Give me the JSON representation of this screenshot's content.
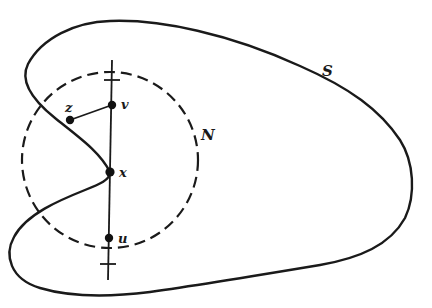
{
  "figure": {
    "colors": {
      "background": "#ffffff",
      "ink": "#1a1a1a"
    },
    "labels": {
      "curve": "S",
      "neighborhood": "N",
      "point_v": "v",
      "point_z": "z",
      "point_x": "x",
      "point_u": "u"
    },
    "elements": {
      "curve_S": "solid closed curve",
      "circle_N": "dashed circle",
      "vertical_line": "line through v, x, u",
      "segment_zv": "line segment from z to v"
    }
  }
}
